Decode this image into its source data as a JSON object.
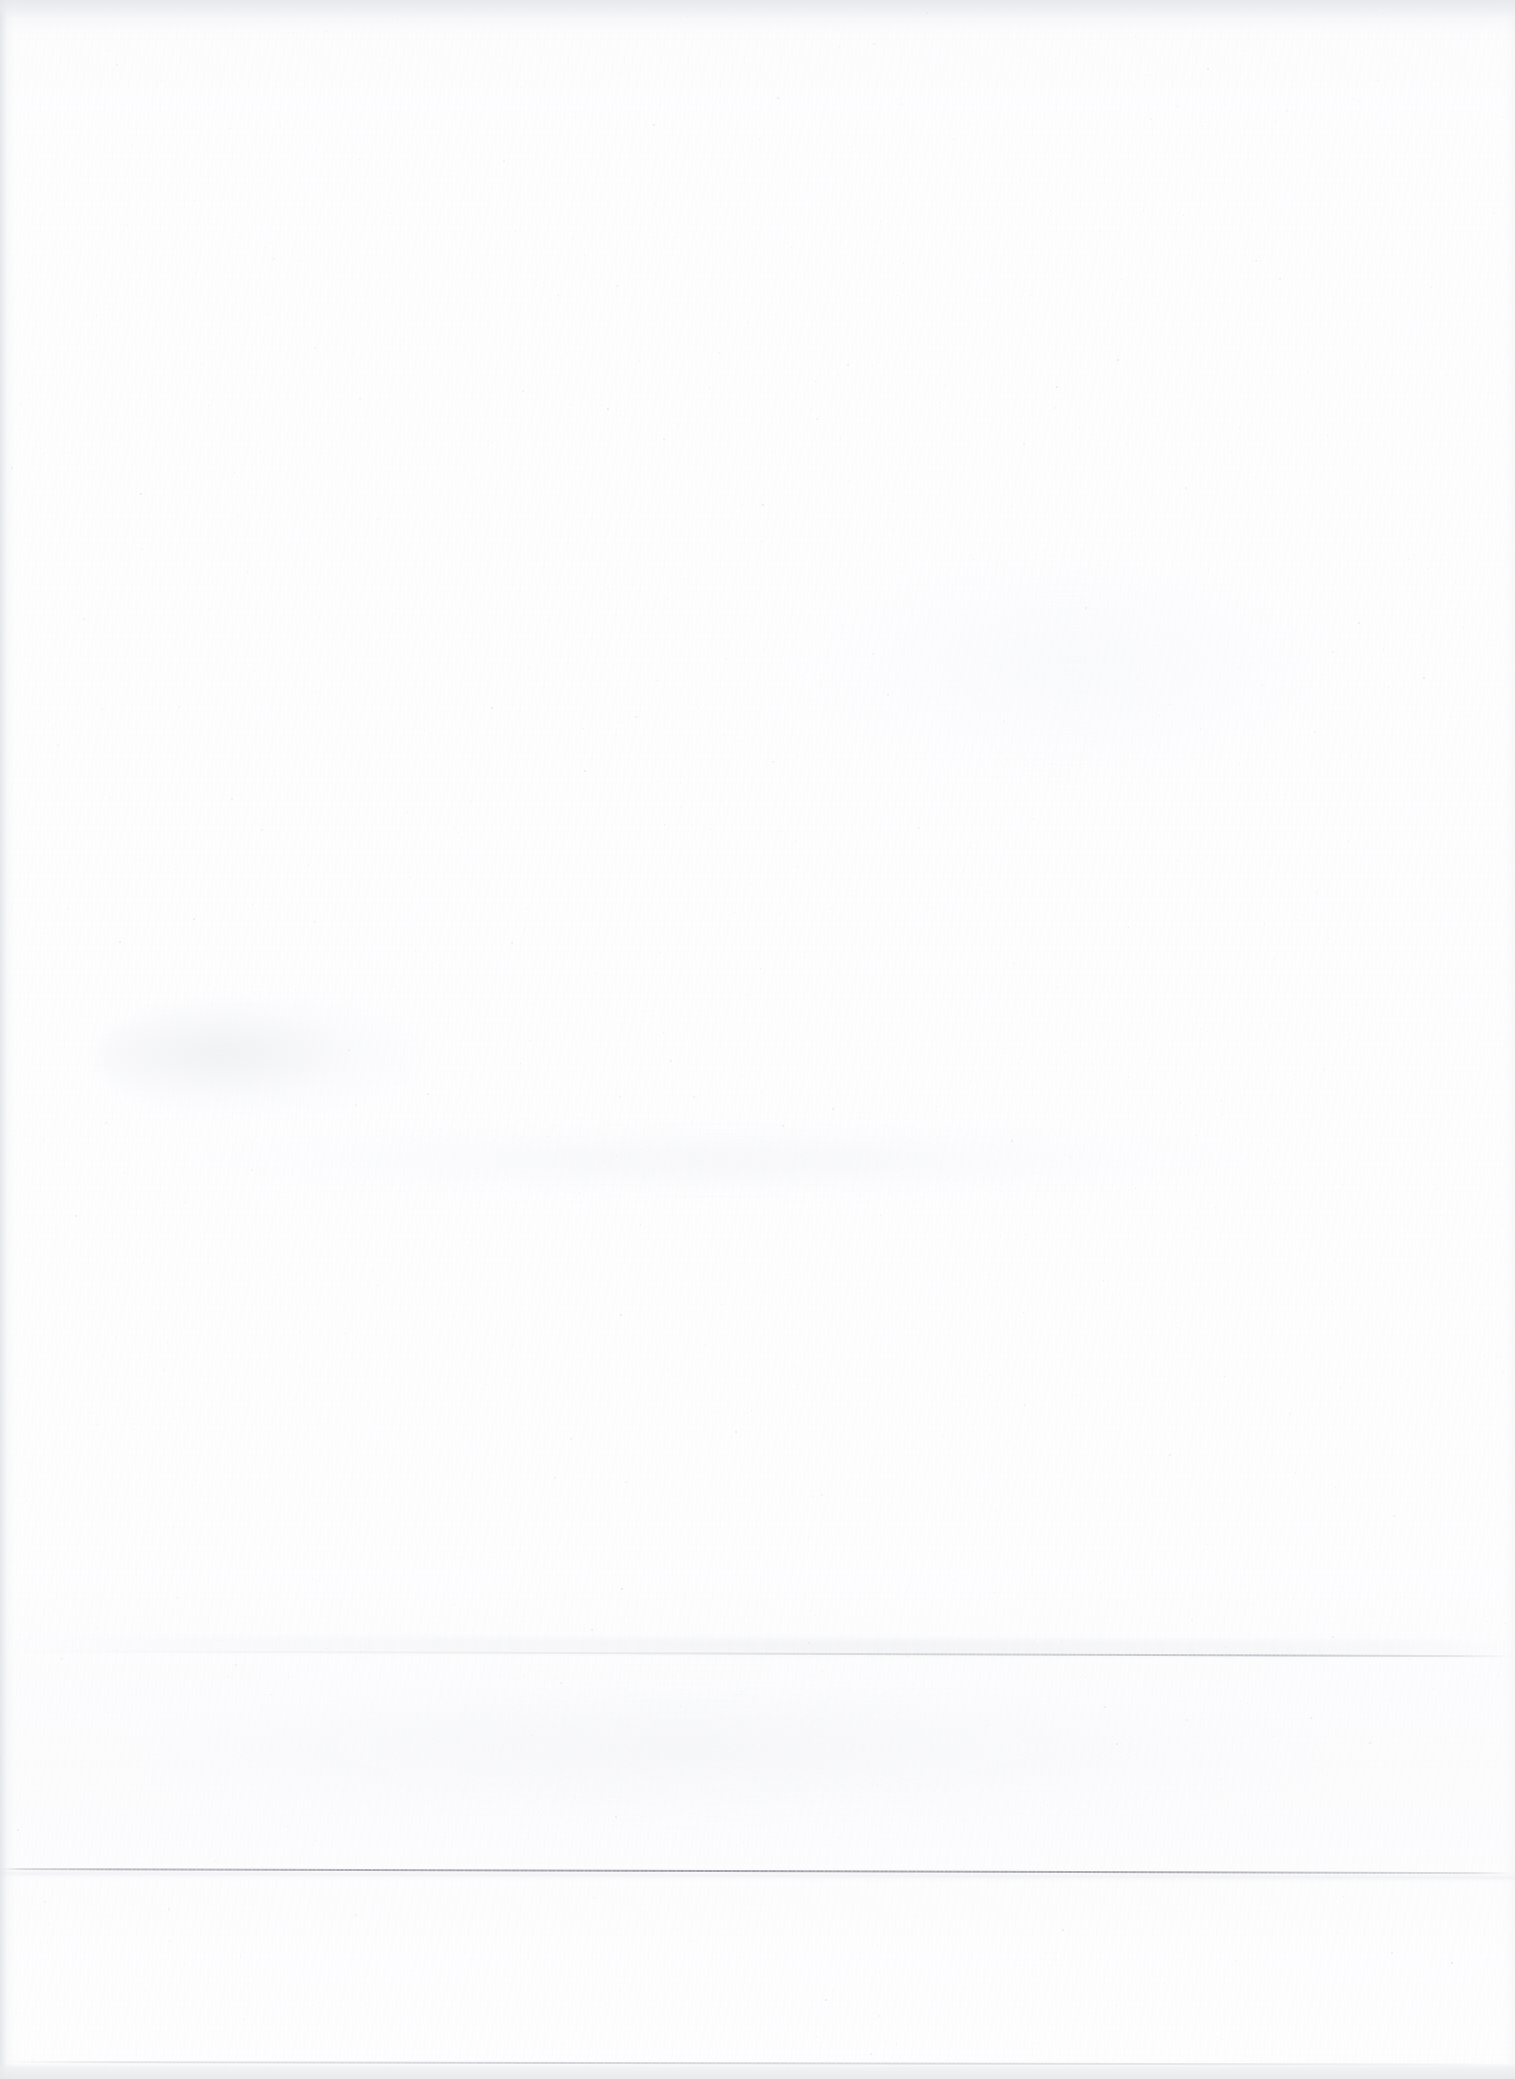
{
  "document": {
    "kind": "scanned-page",
    "content_state": "blank",
    "page_width": 1515,
    "page_height": 2079,
    "visible_text": "",
    "note": "No legible text, headings, figures, tables or captions are rendered on this page."
  },
  "paper": {
    "background_color": "#ffffff",
    "base_tone": "#fefeff",
    "grain_tone": "#f6f6f8",
    "edge_band_color": "#e6e7ea",
    "gutter_shadow_color": "#dbdde1"
  },
  "artifacts": {
    "scan_lines": [
      {
        "name": "primary-scan-line",
        "y": 1868,
        "thickness": 2,
        "tilt_deg": 0.16,
        "color": "#787b84",
        "span": "full-width",
        "description": "Most visible horizontal grey scan line, crosses the whole sheet and slopes slightly downward to the right."
      },
      {
        "name": "secondary-scan-line",
        "y": 1650,
        "thickness": 2,
        "tilt_deg": 0.2,
        "color": "#8f9299",
        "span": "fades-left",
        "description": "Fainter horizontal line, strongest across the right half and fading out toward the left margin."
      },
      {
        "name": "tertiary-scan-line",
        "y": 2061,
        "thickness": 2,
        "tilt_deg": 0.1,
        "color": "#a0a3aa",
        "span": "full-width",
        "description": "Lowest hairline, sits just above the grey strip at the bottom sheet edge."
      }
    ],
    "edges": [
      {
        "name": "top-edge-band",
        "position": "top",
        "height": 18,
        "color": "#e4e6ea"
      },
      {
        "name": "bottom-edge-band",
        "position": "bottom",
        "height": 16,
        "color": "#e6e7ea"
      },
      {
        "name": "left-gutter-shadow",
        "position": "left",
        "width": 26,
        "color": "#dbdde1"
      },
      {
        "name": "right-edge-falloff",
        "position": "right",
        "width": 20,
        "color": "#eeeff1"
      }
    ],
    "smudges": [
      {
        "name": "upper-left-smudge",
        "x": 96,
        "y": 998,
        "width": 330,
        "height": 120
      },
      {
        "name": "mid-page-band-smudge",
        "x": 190,
        "y": 1126,
        "width": 1060,
        "height": 68
      },
      {
        "name": "lower-band-smudge",
        "x": 140,
        "y": 1690,
        "width": 1180,
        "height": 130
      },
      {
        "name": "upper-right-smudge",
        "x": 800,
        "y": 560,
        "width": 520,
        "height": 220
      }
    ],
    "grain": {
      "name": "paper-grain",
      "description": "Fine vertical streak noise from the scanner sensor plus diagonal paper fibre texture.",
      "opacity": 0.55
    }
  }
}
